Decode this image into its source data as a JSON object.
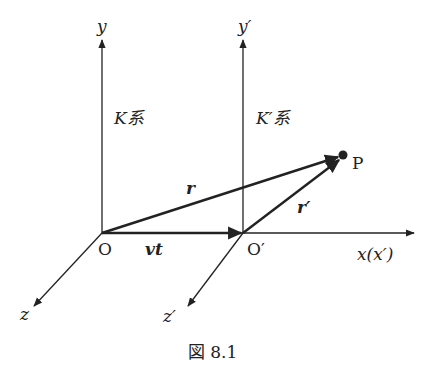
{
  "figure": {
    "caption": "図 8.1",
    "labels": {
      "y": "y",
      "y_prime": "y′",
      "k_system": "K系",
      "k_prime_system": "K′系",
      "r": "r",
      "r_prime": "r′",
      "point": "P",
      "origin": "O",
      "origin_prime": "O′",
      "vt": "vt",
      "x": "x(x′)",
      "z": "z",
      "z_prime": "z′"
    },
    "points": {
      "O": [
        102,
        233
      ],
      "O_prime": [
        243,
        233
      ],
      "P": [
        343,
        155
      ],
      "y_top": [
        102,
        40
      ],
      "y_prime_top": [
        243,
        40
      ],
      "x_end": [
        414,
        233
      ],
      "z_end": [
        34,
        306
      ],
      "z_prime_end": [
        188,
        306
      ]
    },
    "colors": {
      "ink": "#222222",
      "background": "#ffffff"
    }
  }
}
